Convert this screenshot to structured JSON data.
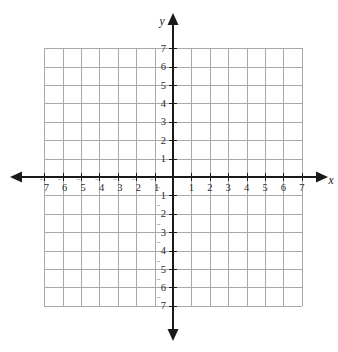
{
  "chart_data": {
    "type": "scatter",
    "title": "",
    "subtitle": "",
    "xlabel": "x",
    "ylabel": "y",
    "xlim": [
      -7,
      7
    ],
    "ylim": [
      -7,
      7
    ],
    "grid": true,
    "legend": null,
    "series": [],
    "annotations": [],
    "x_ticks": [
      -7,
      -6,
      -5,
      -4,
      -3,
      -2,
      -1,
      1,
      2,
      3,
      4,
      5,
      6,
      7
    ],
    "y_ticks": [
      -7,
      -6,
      -5,
      -4,
      -3,
      -2,
      -1,
      1,
      2,
      3,
      4,
      5,
      6,
      7
    ],
    "x_tick_labels": [
      "7",
      "6",
      "5",
      "4",
      "3",
      "2",
      "1",
      "1",
      "2",
      "3",
      "4",
      "5",
      "6",
      "7"
    ],
    "y_tick_labels": [
      "7",
      "6",
      "5",
      "4",
      "3",
      "2",
      "1",
      "1",
      "2",
      "3",
      "4",
      "5",
      "6",
      "7"
    ],
    "negative_sign_glyph": "⁻",
    "tick_interval": 1,
    "origin_label": "",
    "grid_cells_x": 14,
    "grid_cells_y": 14
  },
  "axes": {
    "x_axis_label": "x",
    "y_axis_label": "y"
  },
  "colors": {
    "background": "#ffffff",
    "grid": "#a8a8a8",
    "axis": "#1a1a1a",
    "label": "#2b2b2b"
  }
}
